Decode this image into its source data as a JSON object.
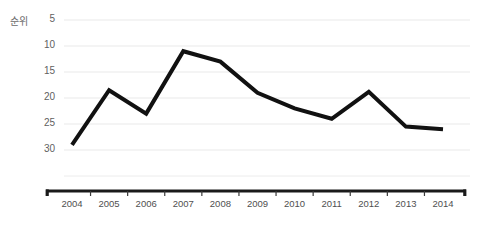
{
  "chart_data": {
    "type": "line",
    "title": "",
    "subtitle": "",
    "xlabel": "",
    "ylabel": "순위",
    "categories": [
      "2004",
      "2005",
      "2006",
      "2007",
      "2008",
      "2009",
      "2010",
      "2011",
      "2012",
      "2013",
      "2014"
    ],
    "values": [
      29,
      18.5,
      23,
      11,
      13,
      19,
      22,
      24,
      18.8,
      25.5,
      26
    ],
    "series": [
      {
        "name": "순위",
        "values": [
          29,
          18.5,
          23,
          11,
          13,
          19,
          22,
          24,
          18.8,
          25.5,
          26
        ]
      }
    ],
    "ylim": [
      5,
      30
    ],
    "y_inverted": true,
    "yticks": [
      5,
      10,
      15,
      20,
      25,
      30
    ],
    "ytick_labels": [
      "5",
      "10",
      "15",
      "20",
      "25",
      "30"
    ],
    "grid": true,
    "grid_axis": "y",
    "legend": false,
    "legend_position": "none",
    "line_color": "#000000",
    "grid_color": "#e9e9e9",
    "axis_color": "#1a1a1a",
    "tick_label_color": "#4f4f4f",
    "annotations": []
  },
  "axis": {
    "y_title": "순위"
  }
}
